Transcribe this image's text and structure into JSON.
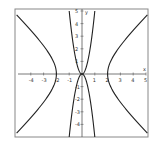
{
  "chart_data": {
    "type": "line",
    "title": "",
    "xlabel": "x",
    "ylabel": "y",
    "xlim": [
      -5,
      5
    ],
    "ylim": [
      -5,
      5
    ],
    "grid": false,
    "x_ticks": [
      -4,
      -3,
      -2,
      -1,
      1,
      2,
      3,
      4,
      5
    ],
    "y_ticks": [
      -4,
      -3,
      -2,
      -1,
      1,
      2,
      3,
      4,
      5
    ],
    "series": [
      {
        "name": "hyperbola (x² − y² = 4), right branch",
        "points": [
          [
            5,
            4.58
          ],
          [
            4,
            3.46
          ],
          [
            3,
            2.24
          ],
          [
            2.5,
            1.5
          ],
          [
            2,
            0
          ],
          [
            2.5,
            -1.5
          ],
          [
            3,
            -2.24
          ],
          [
            4,
            -3.46
          ],
          [
            5,
            -4.58
          ]
        ]
      },
      {
        "name": "hyperbola (x² − y² = 4), left branch",
        "points": [
          [
            -5,
            4.58
          ],
          [
            -4,
            3.46
          ],
          [
            -3,
            2.24
          ],
          [
            -2.5,
            1.5
          ],
          [
            -2,
            0
          ],
          [
            -2.5,
            -1.5
          ],
          [
            -3,
            -2.24
          ],
          [
            -4,
            -3.46
          ],
          [
            -5,
            -4.58
          ]
        ]
      },
      {
        "name": "inner curve, upper",
        "points": [
          [
            -1,
            5
          ],
          [
            -0.7,
            2.5
          ],
          [
            -0.4,
            0.8
          ],
          [
            0,
            0
          ],
          [
            0.4,
            0.8
          ],
          [
            0.7,
            2.5
          ],
          [
            1,
            5
          ]
        ]
      },
      {
        "name": "inner curve, lower",
        "points": [
          [
            -1,
            -5
          ],
          [
            -0.7,
            -2.5
          ],
          [
            -0.4,
            -0.8
          ],
          [
            0,
            0
          ],
          [
            0.4,
            -0.8
          ],
          [
            0.7,
            -2.5
          ],
          [
            1,
            -5
          ]
        ]
      }
    ]
  },
  "axes": {
    "x_label": "x",
    "y_label": "y"
  },
  "ticks": {
    "x": [
      "-4",
      "-3",
      "-2",
      "-1",
      "1",
      "2",
      "3",
      "4",
      "5"
    ],
    "y": [
      "5",
      "4",
      "3",
      "2",
      "1",
      "-1",
      "-2",
      "-3",
      "-4"
    ]
  }
}
